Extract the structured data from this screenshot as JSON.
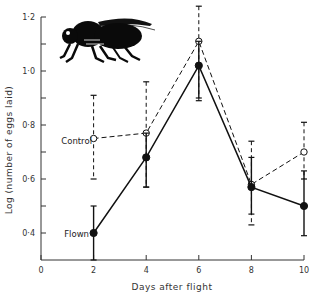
{
  "chart_data": {
    "type": "line",
    "title": "",
    "xlabel": "Days after flight",
    "ylabel": "Log (number of eggs laid)",
    "xlim": [
      0,
      10
    ],
    "ylim": [
      0.3,
      1.2
    ],
    "x_ticks": [
      0,
      2,
      4,
      6,
      8,
      10
    ],
    "x_tick_labels": [
      "0",
      "2",
      "4",
      "6",
      "8",
      "10"
    ],
    "y_ticks": [
      0.4,
      0.6,
      0.8,
      1.0,
      1.2
    ],
    "y_tick_labels": [
      "0·4",
      "0·6",
      "0·8",
      "1·0",
      "1·2"
    ],
    "y_minor_ticks": [
      0.5,
      0.7,
      0.9,
      1.1
    ],
    "grid": false,
    "legend": "inline labels",
    "annotations": [
      "Control",
      "Flown",
      "fly illustration"
    ],
    "x": [
      2,
      4,
      6,
      8,
      10
    ],
    "series": [
      {
        "name": "Control",
        "style": "dashed line, open circles",
        "values": [
          0.75,
          0.77,
          1.11,
          0.58,
          0.7
        ],
        "error_upper": [
          0.91,
          0.96,
          1.24,
          0.74,
          0.81
        ],
        "error_lower": [
          0.6,
          0.57,
          0.89,
          0.43,
          0.6
        ]
      },
      {
        "name": "Flown",
        "style": "solid line, filled circles",
        "values": [
          0.4,
          0.68,
          1.02,
          0.57,
          0.5
        ],
        "error_upper": [
          0.5,
          0.77,
          1.11,
          0.68,
          0.63
        ],
        "error_lower": [
          0.3,
          0.57,
          0.9,
          0.47,
          0.39
        ]
      }
    ]
  },
  "labels": {
    "x_axis_title": "Days after flight",
    "y_axis_title": "Log (number of eggs laid)",
    "control": "Control",
    "flown": "Flown"
  }
}
